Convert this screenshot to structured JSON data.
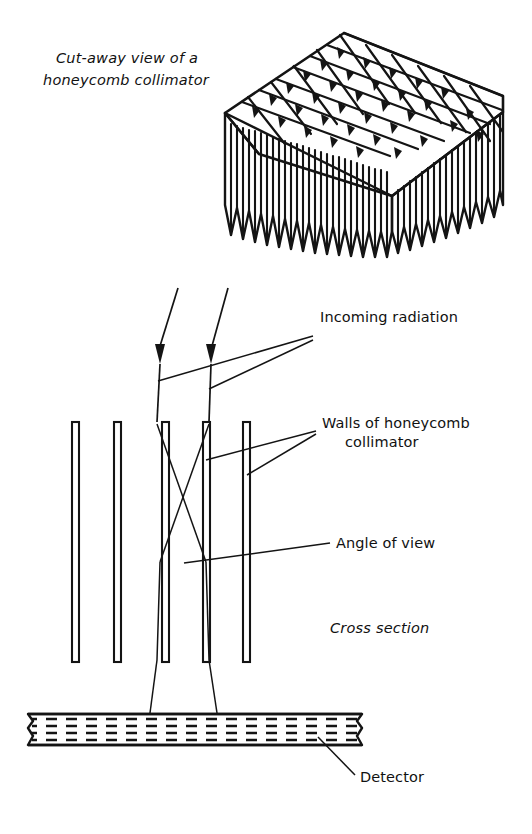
{
  "figure": {
    "title_top": {
      "line1": "Cut-away view of a",
      "line2": "honeycomb collimator"
    },
    "labels": {
      "incoming_radiation": "Incoming radiation",
      "walls_line1": "Walls of honeycomb",
      "walls_line2": "collimator",
      "angle_of_view": "Angle of view",
      "cross_section": "Cross section",
      "detector": "Detector"
    },
    "colors": {
      "ink": "#141414",
      "background": "#ffffff"
    },
    "geometry": {
      "collimator_bar_count": 5,
      "bar_x_positions": [
        75,
        117,
        165,
        206,
        246
      ],
      "bar_top_y": 422,
      "bar_bottom_y": 662,
      "bar_width": 7,
      "ray_arrow_x": [
        160,
        211
      ],
      "detector_top_y": 713,
      "detector_bottom_y": 748,
      "detector_left_x": 28,
      "detector_right_x": 368,
      "honeycomb_columns": 11,
      "honeycomb_rows": 7
    }
  }
}
